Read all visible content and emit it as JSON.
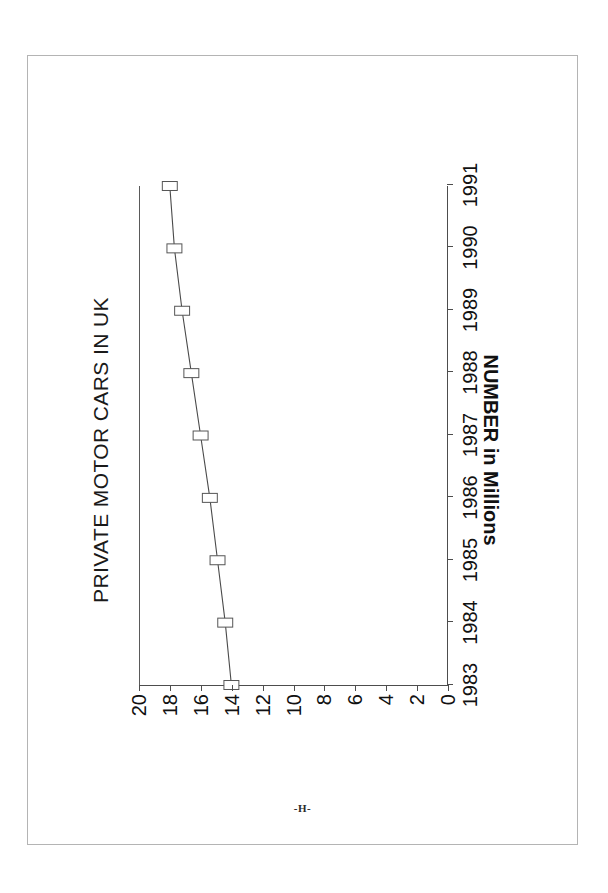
{
  "page": {
    "marker": "-H-",
    "background_color": "#ffffff",
    "border_color": "#b4b4b4"
  },
  "chart_data": {
    "type": "line",
    "title": "PRIVATE MOTOR CARS IN UK",
    "xlabel": "",
    "ylabel": "NUMBER in Millions",
    "categories": [
      "1983",
      "1984",
      "1985",
      "1986",
      "1987",
      "1988",
      "1989",
      "1990",
      "1991"
    ],
    "values": [
      14.0,
      14.4,
      14.9,
      15.4,
      16.0,
      16.6,
      17.2,
      17.7,
      18.0
    ],
    "x": [
      1983,
      1984,
      1985,
      1986,
      1987,
      1988,
      1989,
      1990,
      1991
    ],
    "xlim": [
      1983,
      1991
    ],
    "ylim": [
      0,
      20
    ],
    "yticks": [
      20,
      18,
      16,
      14,
      12,
      10,
      8,
      6,
      4,
      2,
      0
    ],
    "ytick_labels": [
      "20",
      "18",
      "16",
      "14",
      "12",
      "10",
      "8",
      "6",
      "4",
      "2",
      "0"
    ],
    "grid": false,
    "legend": false,
    "marker_style": "open-square",
    "line_color": "#4a4a4a",
    "marker_fill_color": "#ffffff",
    "marker_stroke_color": "#555555",
    "rotation_degrees": -90,
    "ylabel_rotation_degrees": 180
  }
}
